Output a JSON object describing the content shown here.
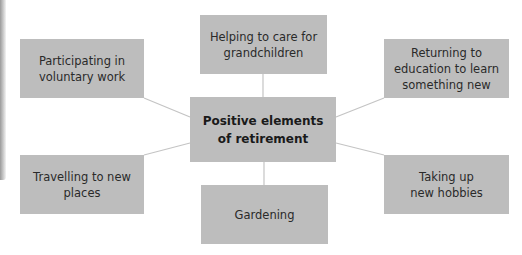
{
  "diagram": {
    "type": "mind-map",
    "colors": {
      "box_fill": "#bdbdbd",
      "connector": "#c4c4c4",
      "text": "#2a2a2a",
      "background": "#ffffff"
    },
    "center": {
      "label": "Positive elements\nof retirement"
    },
    "nodes": [
      {
        "id": "voluntary",
        "label": "Participating in\nvoluntary work"
      },
      {
        "id": "grandchildren",
        "label": "Helping to care for\ngrandchildren"
      },
      {
        "id": "education",
        "label": "Returning to\neducation to learn\nsomething new"
      },
      {
        "id": "travelling",
        "label": "Travelling to new\nplaces"
      },
      {
        "id": "gardening",
        "label": "Gardening"
      },
      {
        "id": "hobbies",
        "label": "Taking up\nnew hobbies"
      }
    ]
  }
}
